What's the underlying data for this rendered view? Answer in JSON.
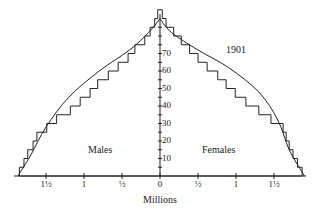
{
  "chart_data": {
    "type": "population-pyramid",
    "title": "1901",
    "xlabel": "Millions",
    "ylabel": "Age",
    "x_ticks": [
      "1½",
      "1",
      "½",
      "0",
      "½",
      "1",
      "1½"
    ],
    "x_tick_values": [
      -1.5,
      -1,
      -0.5,
      0,
      0.5,
      1,
      1.5
    ],
    "y_ticks": [
      10,
      20,
      30,
      40,
      50,
      60,
      70
    ],
    "y_minor_tick_step": 5,
    "xlim": [
      -1.9,
      1.9
    ],
    "ylim": [
      0,
      92
    ],
    "labels": {
      "left": "Males",
      "right": "Females",
      "year": "1901"
    },
    "age_groups": [
      "0-4",
      "5-9",
      "10-14",
      "15-19",
      "20-24",
      "25-29",
      "30-34",
      "35-39",
      "40-44",
      "45-49",
      "50-54",
      "55-59",
      "60-64",
      "65-69",
      "70-74",
      "75-79",
      "80-84",
      "85-89",
      "90+"
    ],
    "series": [
      {
        "name": "Males",
        "side": "left",
        "values": [
          1.85,
          1.79,
          1.74,
          1.67,
          1.62,
          1.49,
          1.36,
          1.18,
          1.05,
          0.92,
          0.82,
          0.68,
          0.55,
          0.42,
          0.33,
          0.2,
          0.13,
          0.07,
          0.03
        ]
      },
      {
        "name": "Females",
        "side": "right",
        "values": [
          1.87,
          1.81,
          1.75,
          1.7,
          1.66,
          1.62,
          1.46,
          1.3,
          1.13,
          0.99,
          0.87,
          0.76,
          0.62,
          0.5,
          0.39,
          0.28,
          0.18,
          0.08,
          0.03
        ]
      },
      {
        "name": "1901 envelope (smooth curve)",
        "type": "line",
        "left_points": [
          [
            -1.87,
            0
          ],
          [
            -1.7,
            12
          ],
          [
            -1.5,
            28
          ],
          [
            -1.2,
            45
          ],
          [
            -0.8,
            60
          ],
          [
            -0.4,
            72
          ],
          [
            -0.15,
            82
          ],
          [
            0,
            90
          ]
        ],
        "right_points": [
          [
            0,
            90
          ],
          [
            0.15,
            82
          ],
          [
            0.5,
            72
          ],
          [
            0.9,
            62
          ],
          [
            1.3,
            48
          ],
          [
            1.55,
            32
          ],
          [
            1.7,
            15
          ],
          [
            1.9,
            0
          ]
        ]
      }
    ]
  }
}
